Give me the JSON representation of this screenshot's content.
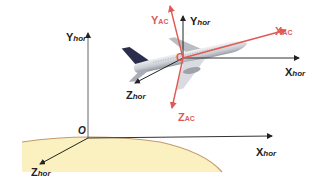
{
  "diagram": {
    "colors": {
      "horizon_axes": "#222222",
      "aircraft_axes": "#e05a55",
      "ground_fill": "#fbf0c0",
      "ground_edge": "#c49a6c"
    },
    "ground_frame": {
      "origin_label": "O",
      "axes": [
        {
          "main": "Y",
          "sub": "hor"
        },
        {
          "main": "X",
          "sub": "hor"
        },
        {
          "main": "Z",
          "sub": "hor"
        }
      ]
    },
    "aircraft_frame": {
      "origin_label": "O",
      "horizon_axes": [
        {
          "main": "Y",
          "sub": "hor"
        },
        {
          "main": "X",
          "sub": "hor"
        },
        {
          "main": "Z",
          "sub": "hor"
        }
      ],
      "body_axes": [
        {
          "main": "Y",
          "sub": "AC"
        },
        {
          "main": "X",
          "sub": "AC"
        },
        {
          "main": "Z",
          "sub": "AC"
        }
      ]
    }
  }
}
